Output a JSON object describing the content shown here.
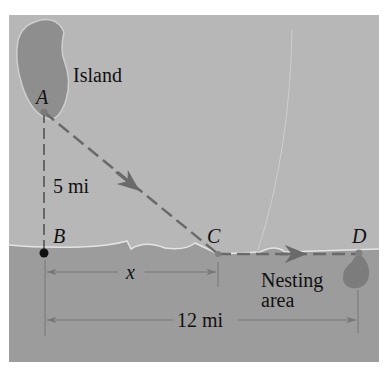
{
  "diagram": {
    "colors": {
      "background": "#ffffff",
      "land": "#b7b7b7",
      "water": "#9c9c9c",
      "island": "#8e8e8e",
      "coastline": "#e4e4e4",
      "path": "#6a6a6a",
      "dim_line": "#777777",
      "text": "#111111"
    },
    "labels": {
      "island": "Island",
      "point_a": "A",
      "point_b": "B",
      "point_c": "C",
      "point_d": "D",
      "ab_distance": "5 mi",
      "bc_distance": "x",
      "bd_distance": "12 mi",
      "nesting_line1": "Nesting",
      "nesting_line2": "area"
    }
  }
}
